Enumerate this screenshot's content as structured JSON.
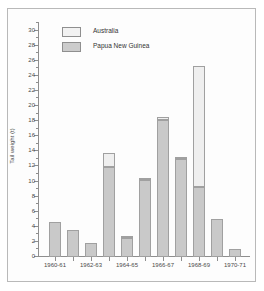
{
  "chart_data": {
    "type": "bar",
    "title": "",
    "subtitle": "",
    "xlabel": "",
    "ylabel": "Tail weight (t)",
    "ylim": [
      0,
      31
    ],
    "ytick_step": 2,
    "yticks": [
      0,
      2,
      4,
      6,
      8,
      10,
      12,
      14,
      16,
      18,
      20,
      22,
      24,
      26,
      28,
      30
    ],
    "grid": false,
    "stacked": true,
    "legend_position": "top-left",
    "categories": [
      "1960-61",
      "",
      "1962-63",
      "",
      "1964-65",
      "",
      "1966-67",
      "",
      "1968-69",
      "",
      "1970-71"
    ],
    "xtick_labels": [
      "1960-61",
      "1962-63",
      "1964-65",
      "1966-67",
      "1968-69",
      "1970-71"
    ],
    "xtick_label_indices": [
      0,
      2,
      4,
      6,
      8,
      10
    ],
    "series": [
      {
        "name": "Papua New Guinea",
        "color": "#c9c9c9",
        "values": [
          4.6,
          3.6,
          1.8,
          11.9,
          2.5,
          10.2,
          18.2,
          13.0,
          9.3,
          5.0,
          1.0
        ]
      },
      {
        "name": "Australia",
        "color": "#efefef",
        "values": [
          0.0,
          0.0,
          0.0,
          1.9,
          0.2,
          0.2,
          0.3,
          0.3,
          16.0,
          0.0,
          0.0
        ]
      }
    ],
    "totals": [
      4.6,
      3.6,
      1.8,
      13.8,
      2.7,
      10.4,
      18.5,
      13.3,
      25.3,
      5.0,
      1.0
    ],
    "annotations": []
  },
  "legend": {
    "items": [
      {
        "label": "Australia",
        "swatch": "aus"
      },
      {
        "label": "Papua New Guinea",
        "swatch": "png"
      }
    ]
  },
  "colors": {
    "papua_new_guinea": "#c9c9c9",
    "australia": "#efefef",
    "bar_border": "#a0a0a0",
    "axis": "#8e8e8e",
    "text": "#4a4a4a",
    "frame": "#b9b9b9"
  }
}
